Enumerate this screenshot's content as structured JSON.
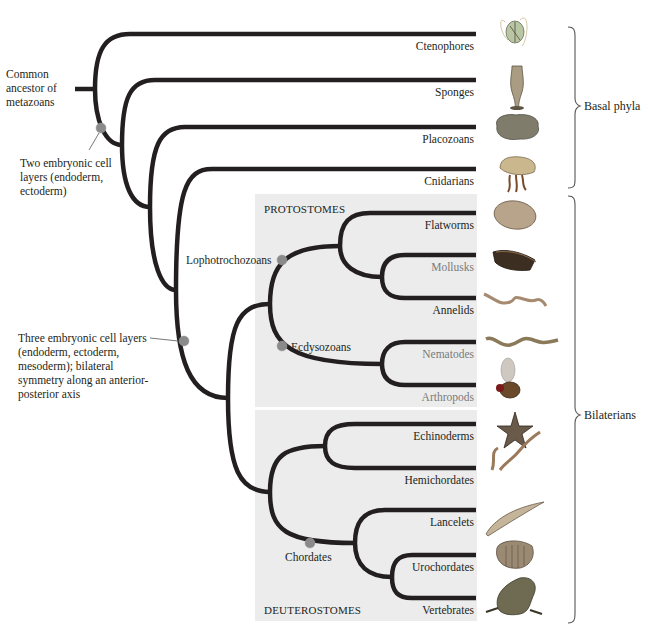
{
  "figure": {
    "colors": {
      "branch": "#231f20",
      "node_marker": "#8a8a8a",
      "panel_fill": "#ececec",
      "muted_label": "#7a7a7a",
      "bracket": "#555555"
    }
  },
  "annotations": {
    "root": "Common ancestor of metazoans",
    "two_layers": "Two embryonic cell layers (endoderm, ectoderm)",
    "three_layers": "Three embryonic cell layers (endoderm, ectoderm, mesoderm); bilateral symmetry along an anterior-posterior axis"
  },
  "groups": {
    "protostomes": "PROTOSTOMES",
    "deuterostomes": "DEUTEROSTOMES",
    "lophotrochozoans": "Lophotrochozoans",
    "ecdysozoans": "Ecdysozoans",
    "chordates": "Chordates"
  },
  "brackets": {
    "basal": "Basal phyla",
    "bilaterians": "Bilaterians"
  },
  "taxa": [
    {
      "name": "Ctenophores",
      "muted": false,
      "illustration": "comb-jelly"
    },
    {
      "name": "Sponges",
      "muted": false,
      "illustration": "sponge"
    },
    {
      "name": "Placozoans",
      "muted": false,
      "illustration": "placozoan"
    },
    {
      "name": "Cnidarians",
      "muted": false,
      "illustration": "jellyfish"
    },
    {
      "name": "Flatworms",
      "muted": false,
      "illustration": "flatworm"
    },
    {
      "name": "Mollusks",
      "muted": true,
      "illustration": "snail"
    },
    {
      "name": "Annelids",
      "muted": false,
      "illustration": "earthworm"
    },
    {
      "name": "Nematodes",
      "muted": true,
      "illustration": "roundworm"
    },
    {
      "name": "Arthropods",
      "muted": true,
      "illustration": "fly"
    },
    {
      "name": "Echinoderms",
      "muted": false,
      "illustration": "starfish"
    },
    {
      "name": "Hemichordates",
      "muted": false,
      "illustration": "acorn-worm"
    },
    {
      "name": "Lancelets",
      "muted": false,
      "illustration": "lancelet"
    },
    {
      "name": "Urochordates",
      "muted": false,
      "illustration": "sea-squirt"
    },
    {
      "name": "Vertebrates",
      "muted": false,
      "illustration": "frog"
    }
  ]
}
